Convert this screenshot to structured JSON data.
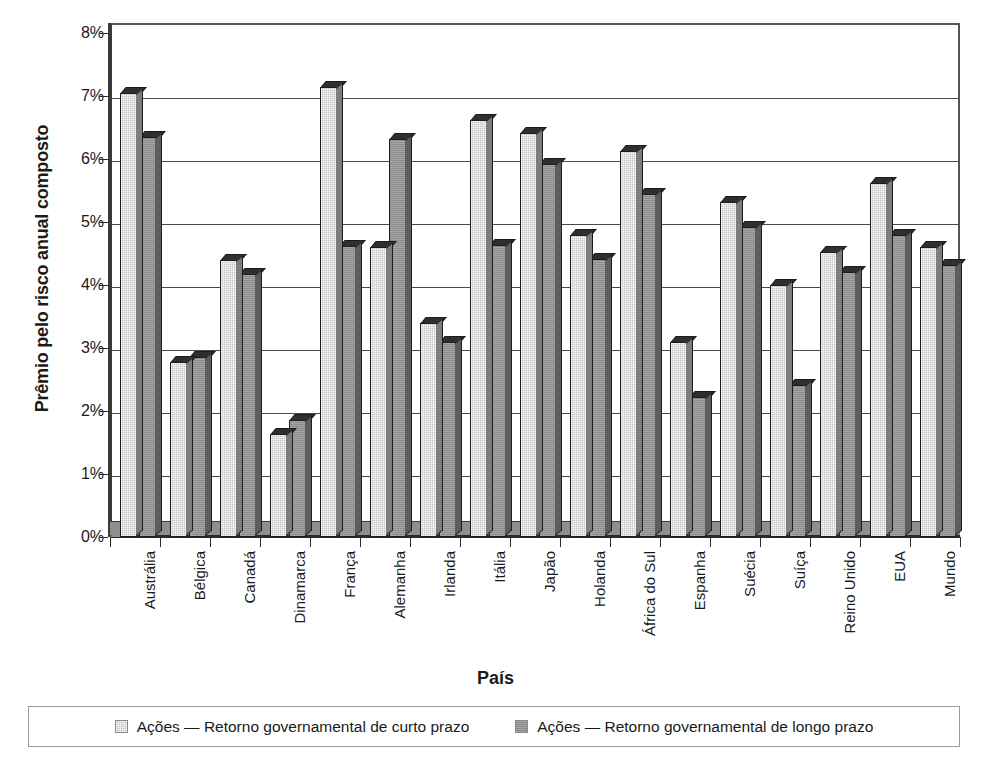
{
  "chart_data": {
    "type": "bar",
    "title": "",
    "xlabel": "País",
    "ylabel": "Prêmio pelo risco anual composto",
    "ylim": [
      0,
      0.08
    ],
    "ytick_labels": [
      "0%",
      "1%",
      "2%",
      "3%",
      "4%",
      "5%",
      "6%",
      "7%",
      "8%"
    ],
    "ytick_values": [
      0,
      1,
      2,
      3,
      4,
      5,
      6,
      7,
      8
    ],
    "grid": true,
    "legend_position": "bottom",
    "categories": [
      "Austrália",
      "Bélgica",
      "Canadá",
      "Dinamarca",
      "França",
      "Alemanha",
      "Irlanda",
      "Itália",
      "Japão",
      "Holanda",
      "África do Sul",
      "Espanha",
      "Suécia",
      "Suíça",
      "Reino Unido",
      "EUA",
      "Mundo"
    ],
    "series": [
      {
        "name": "Ações — Retorno governamental de curto prazo",
        "color": "#c4c4c4",
        "values": [
          7.05,
          2.78,
          4.4,
          1.64,
          7.15,
          4.6,
          3.4,
          6.62,
          6.42,
          4.8,
          6.12,
          3.1,
          5.32,
          4.0,
          4.52,
          5.62,
          4.6
        ]
      },
      {
        "name": "Ações — Retorno governamental de longo prazo",
        "color": "#8c8c8c",
        "values": [
          6.35,
          2.86,
          4.18,
          1.85,
          4.62,
          6.32,
          3.1,
          4.64,
          5.92,
          4.42,
          5.45,
          2.22,
          4.92,
          2.42,
          4.2,
          4.8,
          4.32
        ]
      }
    ]
  },
  "legend": {
    "items": [
      {
        "label": "Ações — Retorno governamental de curto prazo",
        "swatch": "light-gray-swatch"
      },
      {
        "label": "Ações — Retorno governamental de longo prazo",
        "swatch": "dark-gray-swatch"
      }
    ]
  }
}
